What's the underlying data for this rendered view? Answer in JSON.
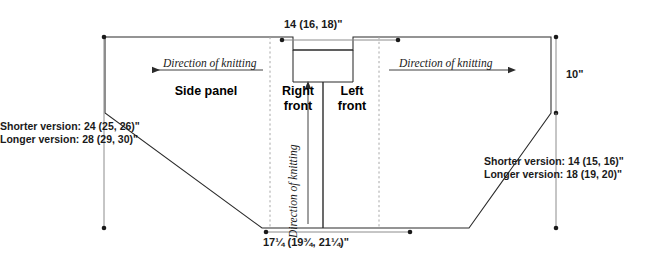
{
  "diagram": {
    "line_color": "#2b2b2b",
    "dim_line_color": "#8c8c8c",
    "dashed_color": "#a8a8a8"
  },
  "dimensions": {
    "top_width": "14 (16, 18)\"",
    "bottom_width": "17¼ (19¾, 21¼)\"",
    "right_height": "10\"",
    "left_shorter": "Shorter version: 24 (25, 26)\"",
    "left_longer": "Longer version: 28 (29, 30)\"",
    "right_shorter": "Shorter version: 14 (15, 16)\"",
    "right_longer": "Longer version: 18 (19, 20)\""
  },
  "panels": {
    "side_panel": "Side panel",
    "right_front_l1": "Right",
    "right_front_l2": "front",
    "left_front_l1": "Left",
    "left_front_l2": "front"
  },
  "annotations": {
    "direction_left": "Direction of knitting",
    "direction_right": "Direction of knitting",
    "direction_center": "Direction of knitting"
  }
}
